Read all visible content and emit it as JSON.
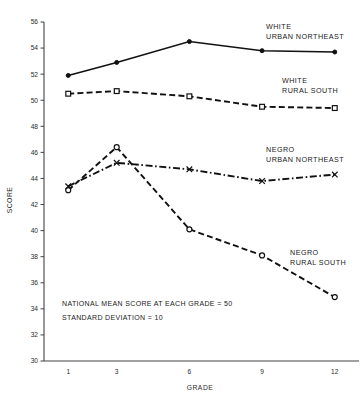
{
  "chart_data": {
    "type": "line",
    "title": "",
    "xlabel": "GRADE",
    "ylabel": "SCORE",
    "x": [
      1,
      3,
      6,
      9,
      12
    ],
    "xtick_labels": [
      "1",
      "3",
      "6",
      "9",
      "12"
    ],
    "xlim": [
      0,
      13
    ],
    "ylim": [
      30,
      56
    ],
    "ytick_labels": [
      "30",
      "32",
      "34",
      "36",
      "38",
      "40",
      "42",
      "44",
      "46",
      "48",
      "50",
      "52",
      "54",
      "56"
    ],
    "ytick_values": [
      30,
      32,
      34,
      36,
      38,
      40,
      42,
      44,
      46,
      48,
      50,
      52,
      54,
      56
    ],
    "grid": false,
    "legend_position": "inline-right",
    "series": [
      {
        "name": "WHITE URBAN NORTHEAST",
        "label_line1": "WHITE",
        "label_line2": "URBAN NORTHEAST",
        "values": [
          51.9,
          52.9,
          54.5,
          53.8,
          53.7
        ],
        "linestyle": "solid",
        "marker": "dot",
        "color": "#111111"
      },
      {
        "name": "WHITE RURAL SOUTH",
        "label_line1": "WHITE",
        "label_line2": "RURAL SOUTH",
        "values": [
          50.5,
          50.7,
          50.3,
          49.5,
          49.4
        ],
        "linestyle": "dashed",
        "marker": "square",
        "color": "#111111"
      },
      {
        "name": "NEGRO URBAN NORTHEAST",
        "label_line1": "NEGRO",
        "label_line2": "URBAN NORTHEAST",
        "values": [
          43.4,
          45.2,
          44.7,
          43.8,
          44.3
        ],
        "linestyle": "dashdot",
        "marker": "x",
        "color": "#111111"
      },
      {
        "name": "NEGRO RURAL SOUTH",
        "label_line1": "NEGRO",
        "label_line2": "RURAL SOUTH",
        "values": [
          43.1,
          46.4,
          40.1,
          38.1,
          34.9
        ],
        "linestyle": "dashed",
        "marker": "circle",
        "color": "#111111"
      }
    ],
    "annotations": [
      "NATIONAL MEAN SCORE AT EACH GRADE = 50",
      "STANDARD DEVIATION = 10"
    ]
  }
}
